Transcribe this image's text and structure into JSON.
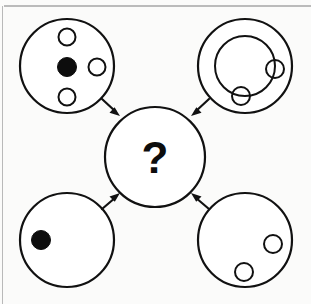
{
  "figure": {
    "canvas": {
      "width": 311,
      "height": 304
    },
    "background_color": "#fbfbfa",
    "ink_color": "#111111",
    "fill_color": "#0d0d0d",
    "center_label": "?",
    "rules": [
      {
        "name": "top-horizontal-rule",
        "x1": 4,
        "y1": 6,
        "x2": 311,
        "y2": 6,
        "color": "#7d7d7d"
      },
      {
        "name": "left-vertical-rule",
        "x1": 2.5,
        "y1": 6,
        "x2": 2.5,
        "y2": 304,
        "color": "#b9b9b9"
      }
    ],
    "nodes": [
      {
        "id": "top-left",
        "name": "circle-top-left",
        "cx": 67,
        "cy": 66,
        "r": 47,
        "description": "One filled dot at center with three open circles around it",
        "contents": [
          {
            "kind": "filled",
            "cx": 67,
            "cy": 67,
            "r": 9.5
          },
          {
            "kind": "open",
            "cx": 67,
            "cy": 37,
            "r": 8.5
          },
          {
            "kind": "open",
            "cx": 97,
            "cy": 67,
            "r": 8.5
          },
          {
            "kind": "open",
            "cx": 67,
            "cy": 97,
            "r": 8.5
          }
        ]
      },
      {
        "id": "top-right",
        "name": "circle-top-right",
        "cx": 245,
        "cy": 66,
        "r": 47,
        "description": "Concentric inner ring with two small open circles on the ring",
        "inner_ring": {
          "cx": 245,
          "cy": 66,
          "r": 30
        },
        "contents": [
          {
            "kind": "open-on-ring",
            "cx": 275,
            "cy": 69,
            "r": 9
          },
          {
            "kind": "open-on-ring",
            "cx": 241,
            "cy": 96,
            "r": 9
          }
        ]
      },
      {
        "id": "bottom-left",
        "name": "circle-bottom-left",
        "cx": 67,
        "cy": 240,
        "r": 47,
        "description": "Single filled dot on the left side",
        "contents": [
          {
            "kind": "filled",
            "cx": 41,
            "cy": 240,
            "r": 9.5
          }
        ]
      },
      {
        "id": "bottom-right",
        "name": "circle-bottom-right",
        "cx": 245,
        "cy": 240,
        "r": 47,
        "description": "Two small open circles on the lower right",
        "contents": [
          {
            "kind": "open",
            "cx": 273,
            "cy": 244,
            "r": 9
          },
          {
            "kind": "open",
            "cx": 244,
            "cy": 272,
            "r": 9
          }
        ]
      },
      {
        "id": "center",
        "name": "circle-center-unknown",
        "cx": 155,
        "cy": 157,
        "r": 50,
        "description": "Target circle containing a question mark",
        "label": "?",
        "contents": []
      }
    ],
    "arrows": [
      {
        "id": "arrow-top-left",
        "name": "arrow-top-left-to-center",
        "from": "top-left",
        "to": "center",
        "x1": 102,
        "y1": 99,
        "x2": 119,
        "y2": 115
      },
      {
        "id": "arrow-top-right",
        "name": "arrow-top-right-to-center",
        "from": "top-right",
        "to": "center",
        "x1": 208,
        "y1": 99,
        "x2": 191,
        "y2": 115
      },
      {
        "id": "arrow-bottom-left",
        "name": "arrow-bottom-left-to-center",
        "from": "bottom-left",
        "to": "center",
        "x1": 102,
        "y1": 208,
        "x2": 119,
        "y2": 194
      },
      {
        "id": "arrow-bottom-right",
        "name": "arrow-bottom-right-to-center",
        "from": "bottom-right",
        "to": "center",
        "x1": 208,
        "y1": 208,
        "x2": 191,
        "y2": 194
      }
    ]
  }
}
